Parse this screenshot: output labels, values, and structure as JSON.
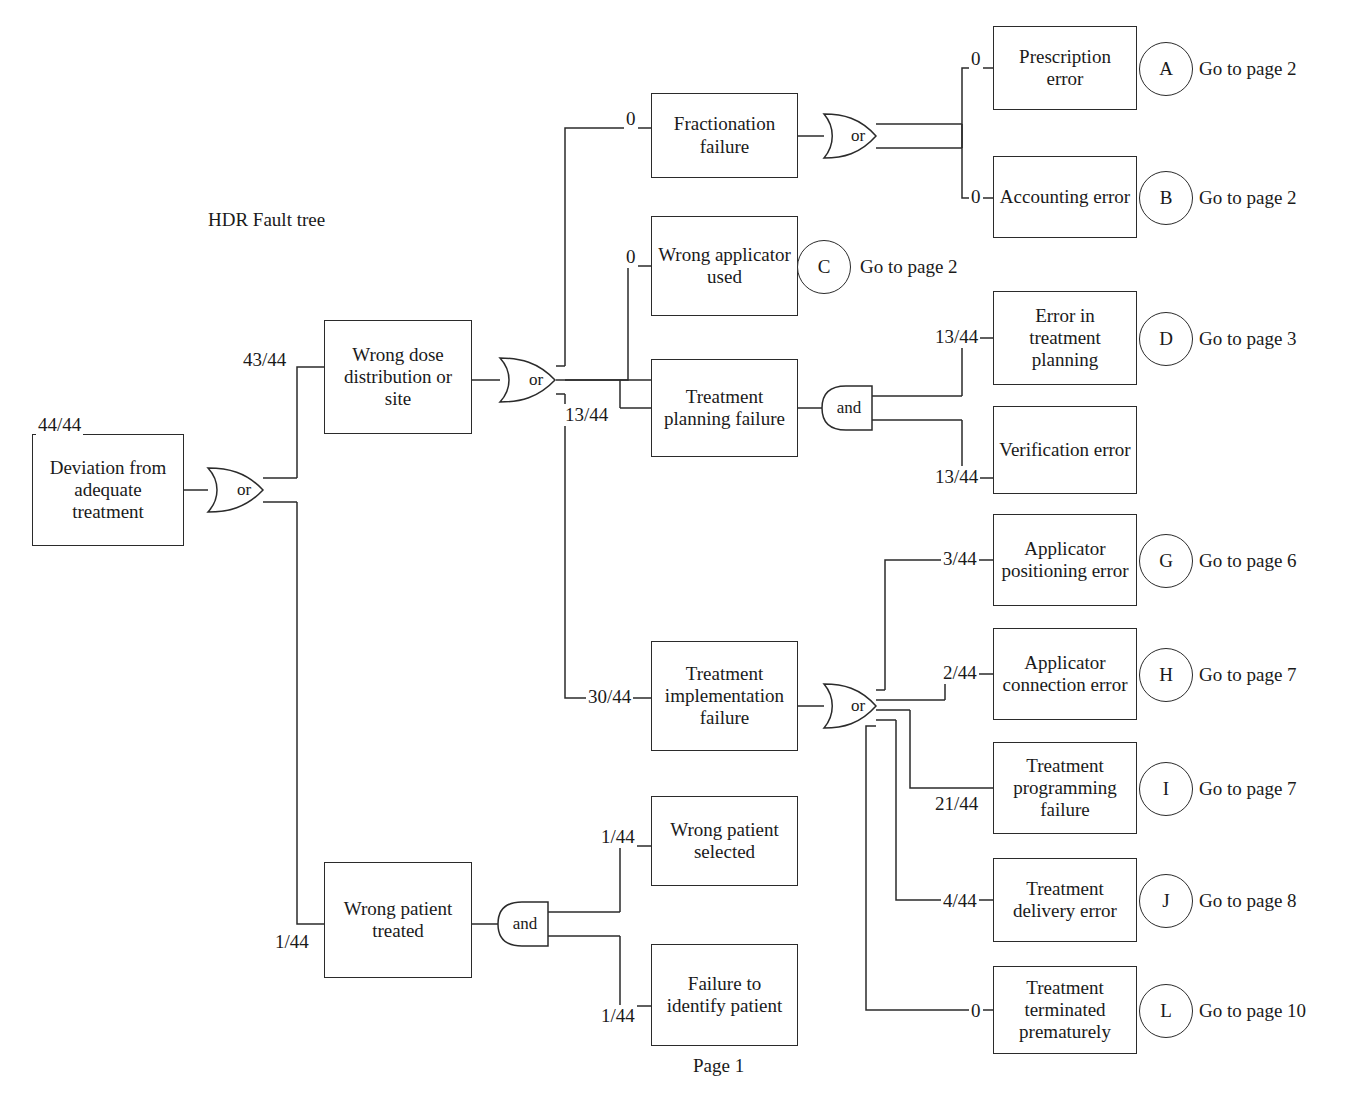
{
  "diagram": {
    "title": "HDR Fault tree",
    "page_label": "Page 1",
    "type": "fault-tree"
  },
  "nodes": {
    "root": {
      "label": "Deviation from adequate treatment",
      "value": "44/44"
    },
    "wrong_dose": {
      "label": "Wrong dose distribution or site",
      "value": "43/44"
    },
    "wrong_pat": {
      "label": "Wrong patient treated",
      "value": "1/44"
    },
    "fraction": {
      "label": "Fractionation failure",
      "value": "0"
    },
    "applicator": {
      "label": "Wrong applicator used",
      "value": "0"
    },
    "tpf": {
      "label": "Treatment planning failure",
      "value": "13/44"
    },
    "tif": {
      "label": "Treatment implementation failure",
      "value": "30/44"
    },
    "prescription": {
      "label": "Prescription error",
      "value": "0"
    },
    "accounting": {
      "label": "Accounting error",
      "value": "0"
    },
    "err_plan": {
      "label": "Error in treatment planning",
      "value": "13/44"
    },
    "verification": {
      "label": "Verification error",
      "value": "13/44"
    },
    "app_pos": {
      "label": "Applicator positioning error",
      "value": "3/44"
    },
    "app_conn": {
      "label": "Applicator connection error",
      "value": "2/44"
    },
    "prog_fail": {
      "label": "Treatment programming failure",
      "value": "21/44"
    },
    "delivery": {
      "label": "Treatment delivery error",
      "value": "4/44"
    },
    "terminated": {
      "label": "Treatment terminated prematurely",
      "value": "0"
    },
    "wrong_sel": {
      "label": "Wrong patient selected",
      "value": "1/44"
    },
    "fail_id": {
      "label": "Failure to identify patient",
      "value": "1/44"
    }
  },
  "gates": {
    "root_or": {
      "label": "or",
      "kind": "or"
    },
    "dose_or": {
      "label": "or",
      "kind": "or"
    },
    "fract_or": {
      "label": "or",
      "kind": "or"
    },
    "tpf_and": {
      "label": "and",
      "kind": "and"
    },
    "tif_or": {
      "label": "or",
      "kind": "or"
    },
    "pat_and": {
      "label": "and",
      "kind": "and"
    }
  },
  "transfers": [
    {
      "id": "A",
      "goto": "Go to page 2"
    },
    {
      "id": "B",
      "goto": "Go to page 2"
    },
    {
      "id": "C",
      "goto": "Go to page 2"
    },
    {
      "id": "D",
      "goto": "Go to page 3"
    },
    {
      "id": "G",
      "goto": "Go to page 6"
    },
    {
      "id": "H",
      "goto": "Go to page 7"
    },
    {
      "id": "I",
      "goto": "Go to page 7"
    },
    {
      "id": "J",
      "goto": "Go to page 8"
    },
    {
      "id": "L",
      "goto": "Go to page 10"
    }
  ],
  "colors": {
    "line": "#2b2b2b",
    "text": "#1a1a1a",
    "background": "#ffffff"
  }
}
